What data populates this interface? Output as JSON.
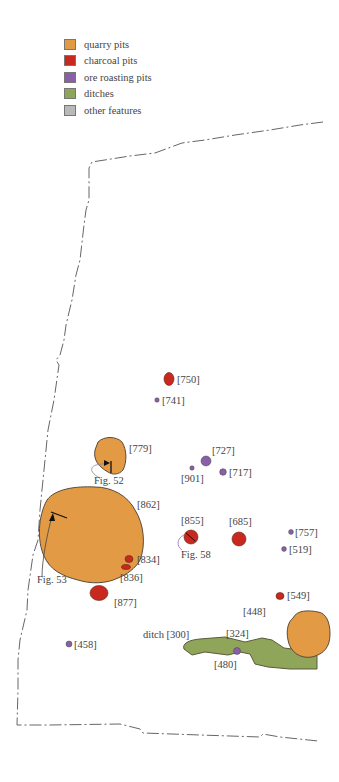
{
  "legend": {
    "items": [
      {
        "label": "quarry pits",
        "color": "#e39a45"
      },
      {
        "label": "charcoal pits",
        "color": "#c8281e"
      },
      {
        "label": "ore roasting pits",
        "color": "#8a5fa8"
      },
      {
        "label": "ditches",
        "color": "#8fa55a"
      },
      {
        "label": "other features",
        "color": "#b9b9b9"
      }
    ]
  },
  "colors": {
    "quarry": "#e39a45",
    "charcoal": "#c8281e",
    "ore": "#8a5fa8",
    "ditch": "#8fa55a",
    "outline": "#5a4a3a",
    "boundary": "#666666"
  },
  "features": {
    "quarry_pits": [
      "[862]",
      "[779]",
      "[448]"
    ],
    "charcoal_pits": [
      "[750]",
      "[855]",
      "[685]",
      "[834]",
      "[836]",
      "[877]",
      "[549]"
    ],
    "ore_roasting_pits": [
      "[741]",
      "[727]",
      "[901]",
      "[717]",
      "[757]",
      "[519]",
      "[458]",
      "[480]"
    ],
    "ditches": [
      "ditch [300]"
    ],
    "other": [
      "[324]"
    ]
  },
  "labels": {
    "l750": "[750]",
    "l741": "[741]",
    "l779": "[779]",
    "fig52": "Fig. 52",
    "l727": "[727]",
    "l901": "[901]",
    "l717": "[717]",
    "l862": "[862]",
    "l855": "[855]",
    "l685": "[685]",
    "l757": "[757]",
    "l519": "[519]",
    "fig58": "Fig. 58",
    "l834": "[834]",
    "l836": "[836]",
    "fig53": "Fig. 53",
    "l877": "[877]",
    "l549": "[549]",
    "l448": "[448]",
    "ditch300": "ditch [300]",
    "l324": "[324]",
    "l458": "[458]",
    "l480": "[480]"
  }
}
